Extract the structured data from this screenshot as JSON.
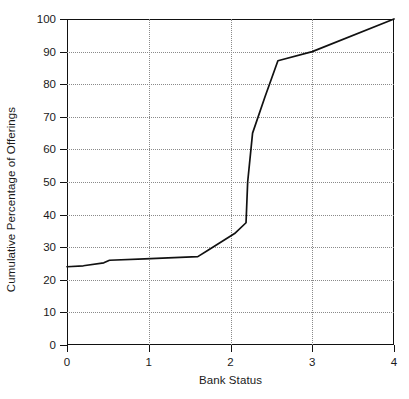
{
  "chart_data": {
    "type": "line",
    "title": "",
    "xlabel": "Bank Status",
    "ylabel": "Cumulative Percentage of Offerings",
    "xlim": [
      0,
      4
    ],
    "ylim": [
      0,
      100
    ],
    "xticks": [
      "0",
      "1",
      "2",
      "3",
      "4"
    ],
    "yticks": [
      "0",
      "10",
      "20",
      "30",
      "40",
      "50",
      "60",
      "70",
      "80",
      "90",
      "100"
    ],
    "grid": "dotted both axes",
    "legend": "none",
    "line_color": "#111111",
    "series": [
      {
        "name": "Cumulative distribution",
        "x": [
          0.0,
          0.2,
          0.45,
          0.52,
          0.95,
          1.6,
          1.72,
          2.05,
          2.19,
          2.21,
          2.27,
          2.42,
          2.58,
          3.0,
          4.0
        ],
        "y": [
          24.0,
          24.3,
          25.2,
          26.0,
          26.4,
          27.1,
          29.0,
          34.2,
          37.5,
          50.0,
          65.0,
          76.0,
          87.2,
          90.0,
          100.0
        ]
      }
    ]
  },
  "axes": {
    "x_title": "Bank Status",
    "y_title": "Cumulative Percentage of Offerings"
  }
}
